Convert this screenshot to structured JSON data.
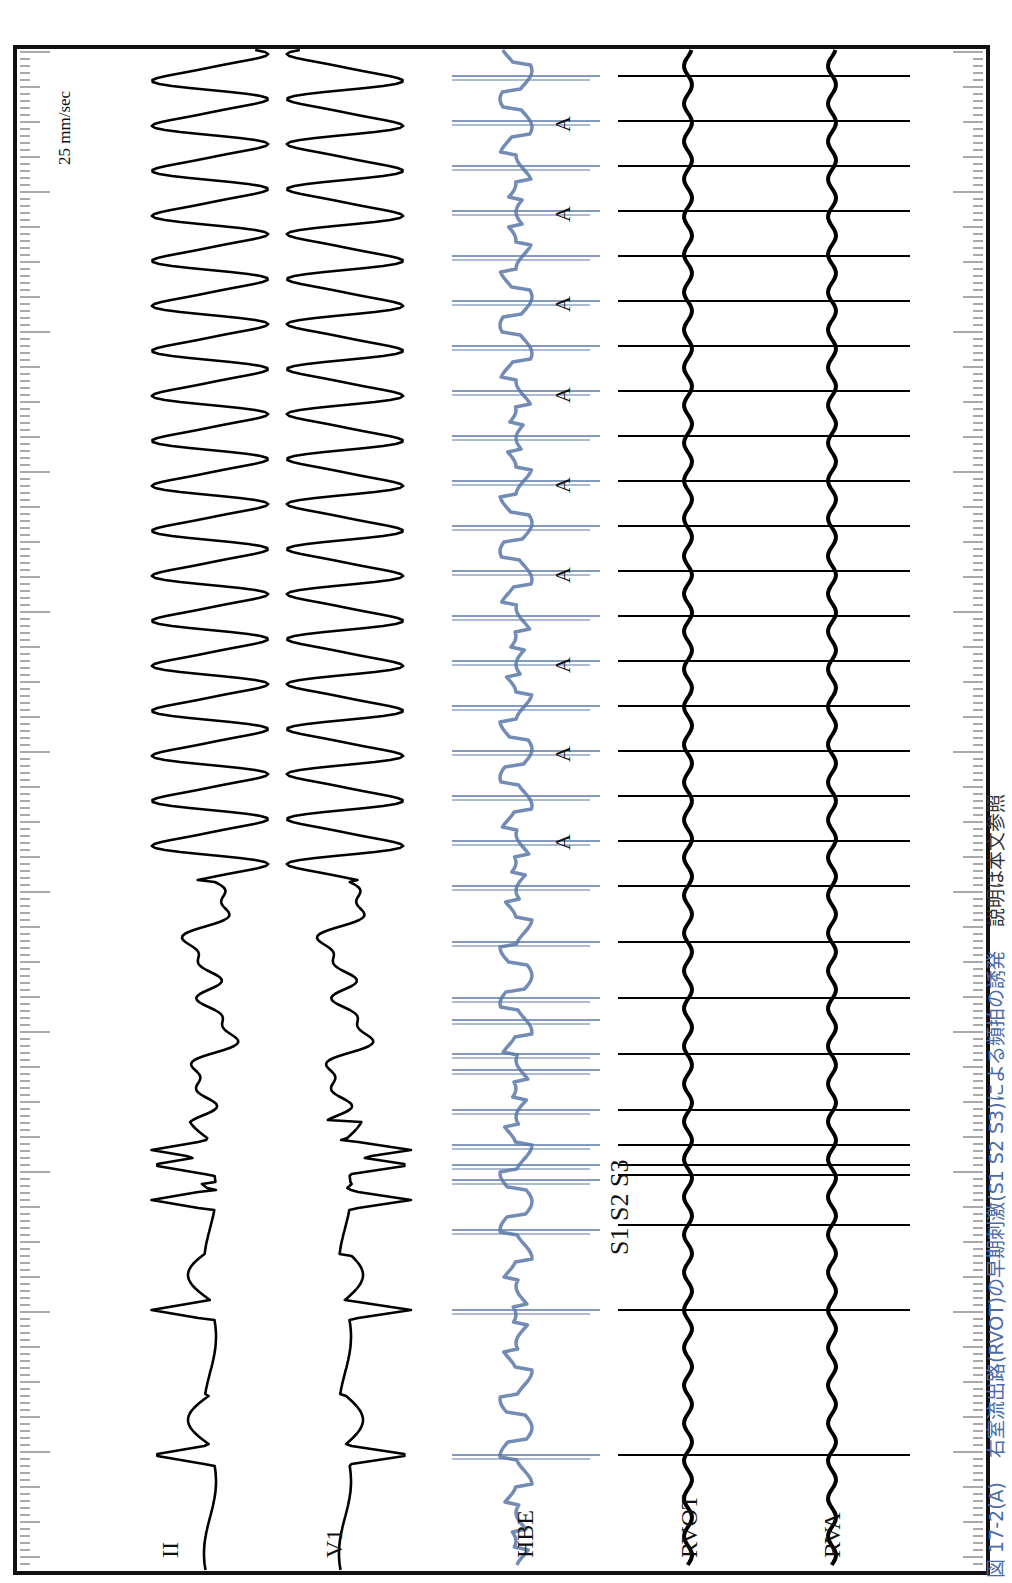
{
  "figure": {
    "orientation": "rotated-90-ccw",
    "speed_label": "25 mm/sec",
    "caption": {
      "number": "図 17-2(A)",
      "text": "右室流出路(RVOT)の早期刺激(S1 S2 S3)による頻拍の誘発",
      "note": "説明は本文参照",
      "color_main": "#4a6aa8",
      "color_note": "#333333"
    },
    "leads": [
      {
        "id": "II",
        "label": "II",
        "color": "#000000"
      },
      {
        "id": "V1",
        "label": "V1",
        "color": "#000000"
      },
      {
        "id": "HBE",
        "label": "HBE",
        "color": "#5a78a8"
      },
      {
        "id": "RVOT",
        "label": "RVOT",
        "color": "#000000"
      },
      {
        "id": "RVA",
        "label": "RVA",
        "color": "#000000"
      }
    ],
    "stimulus_labels": {
      "s1": "S1",
      "s2": "S2",
      "s3": "S3",
      "combined": "S1 S2 S3"
    },
    "atrial_marker": "A",
    "atrial_marker_count": 9,
    "paced_beats_count": 3,
    "tachycardia_beats_count": 18
  }
}
